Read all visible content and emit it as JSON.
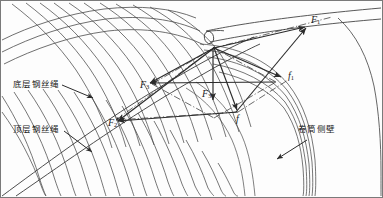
{
  "figure": {
    "type": "engineering-force-diagram",
    "background": "#fdfdfd",
    "line_color": "#3a3a3a",
    "text_color": "#1a1a1a"
  },
  "annotations": {
    "bottom_layer_rope": "底层钢丝绳",
    "top_layer_rope": "顶层钢丝绳",
    "drum_side_wall": "卷筒侧壁"
  },
  "force_labels": {
    "f1_upper": "F",
    "f1_upper_sub": "1",
    "f2_lower_left": "F",
    "f2_lower_left_sub": "2",
    "f3_mid_left": "F",
    "f3_mid_left_sub": "3",
    "f3_center": "F",
    "f3_center_sub": "3",
    "f_small": "f",
    "f1_small": "f",
    "f1_small_sub": "1"
  },
  "vectors": [
    {
      "name": "F1",
      "label": "F₁",
      "from": "origin",
      "direction": "up-right",
      "style": "solid-arrow"
    },
    {
      "name": "F2",
      "label": "F₂",
      "from": "origin",
      "direction": "down-left",
      "style": "solid-arrow"
    },
    {
      "name": "F3-left",
      "label": "F₃",
      "from": "origin",
      "direction": "left",
      "style": "solid-arrow"
    },
    {
      "name": "F3-center",
      "label": "F₃",
      "from": "origin",
      "direction": "down",
      "style": "solid-arrow"
    },
    {
      "name": "f",
      "label": "f",
      "from": "origin",
      "direction": "down-right",
      "style": "solid-arrow"
    },
    {
      "name": "f1",
      "label": "f₁",
      "from": "origin",
      "direction": "right-down",
      "style": "solid-arrow"
    }
  ],
  "construction_lines": {
    "style": "dash-dot",
    "description": "parallelogram decomposition guides"
  },
  "leader_arrows": [
    {
      "name": "bottom-layer-leader",
      "direction": "down-right"
    },
    {
      "name": "top-layer-leader",
      "direction": "down-right"
    },
    {
      "name": "drum-wall-leader",
      "direction": "down-left"
    }
  ]
}
